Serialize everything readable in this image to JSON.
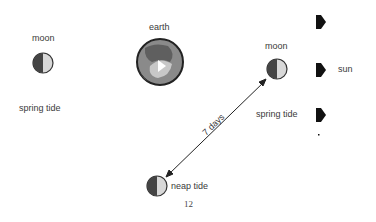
{
  "labels": {
    "moon_left": "moon",
    "earth": "earth",
    "moon_right": "moon",
    "sun": "sun",
    "spring_tide_left": "spring tide",
    "spring_tide_right": "spring tide",
    "neap_tide": "neap tide",
    "interval": "7 days",
    "page_number": "12"
  },
  "colors": {
    "moon_dark": "#444444",
    "moon_light": "#d8d8d8",
    "earth_outline": "#222222",
    "sun_arrows": "#111111"
  }
}
